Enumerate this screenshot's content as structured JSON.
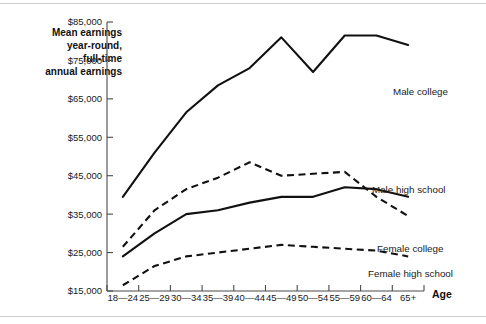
{
  "figure": {
    "background_color": "#ffffff",
    "rule_color": "#cfcfcf",
    "line_color": "#111111",
    "axis_color": "#4a4a4a"
  },
  "chart_data": {
    "type": "line",
    "title": "",
    "ylabel": "Mean earnings year-round, full-time annual earnings",
    "ylabel_lines": [
      "Mean earnings",
      "year-round,",
      "full-time",
      "annual earnings"
    ],
    "xlabel": "Age",
    "categories": [
      "18—24",
      "25—29",
      "30—34",
      "35—39",
      "40—44",
      "45—49",
      "50—54",
      "55—59",
      "60—64",
      "65+"
    ],
    "ylim": [
      15000,
      85000
    ],
    "ytick_values": [
      15000,
      25000,
      35000,
      45000,
      55000,
      65000,
      75000,
      85000
    ],
    "ytick_labels": [
      "$15,000",
      "$25,000",
      "$35,000",
      "$45,000",
      "$55,000",
      "$65,000",
      "$75,000",
      "$85,000"
    ],
    "grid": false,
    "legend_position": "right-inline-labels",
    "series": [
      {
        "name": "Male college",
        "style": "solid",
        "label": "Male college",
        "values": [
          39500,
          51000,
          61500,
          68500,
          73000,
          81000,
          72000,
          81500,
          81500,
          79000
        ]
      },
      {
        "name": "Male high school",
        "style": "solid",
        "label": "Male high school",
        "values": [
          24000,
          30000,
          35000,
          36000,
          38000,
          39500,
          39500,
          42000,
          41500,
          39500
        ]
      },
      {
        "name": "Female college",
        "style": "dashed",
        "label": "Female college",
        "values": [
          26500,
          36000,
          41500,
          44500,
          48500,
          45000,
          45500,
          46000,
          39500,
          34500
        ]
      },
      {
        "name": "Female high school",
        "style": "dashed",
        "label": "Female high school",
        "values": [
          16500,
          21500,
          24000,
          25000,
          26000,
          27000,
          26500,
          26000,
          25500,
          24000
        ]
      }
    ]
  }
}
